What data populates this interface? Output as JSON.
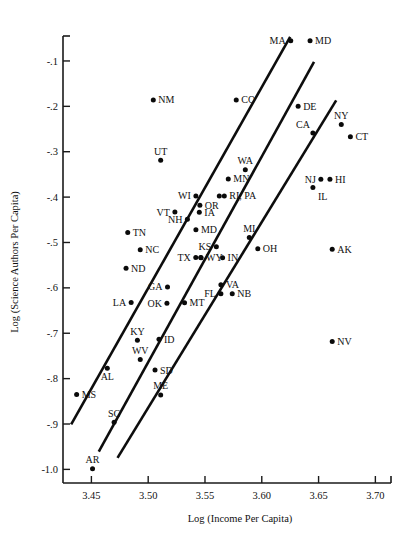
{
  "chart_data": {
    "type": "scatter",
    "title": "",
    "xlabel": "Log (Income Per Capita)",
    "ylabel": "Log (Science Authors Per Capita)",
    "xlim": [
      3.425,
      3.712
    ],
    "ylim": [
      -1.03,
      -0.045
    ],
    "grid": false,
    "legend": "none",
    "xticks": [
      "3.45",
      "3.50",
      "3.55",
      "3.60",
      "3.65",
      "3.70"
    ],
    "xtickvalues": [
      3.45,
      3.5,
      3.55,
      3.6,
      3.65,
      3.7
    ],
    "yticks": [
      "-.1",
      "-.2",
      "-.3",
      "-.4",
      "-.5",
      "-.6",
      "-.7",
      "-.8",
      "-.9",
      "-1.0"
    ],
    "ytickvalues": [
      -0.1,
      -0.2,
      -0.3,
      -0.4,
      -0.5,
      -0.6,
      -0.7,
      -0.8,
      -0.9,
      -1.0
    ],
    "points": [
      {
        "label": "MA",
        "x": 3.6255,
        "y": -0.0555,
        "lp": "left"
      },
      {
        "label": "MD",
        "x": 3.6425,
        "y": -0.0555,
        "lp": "right"
      },
      {
        "label": "NM",
        "x": 3.5045,
        "y": -0.186,
        "lp": "right"
      },
      {
        "label": "CO",
        "x": 3.5775,
        "y": -0.186,
        "lp": "right"
      },
      {
        "label": "DE",
        "x": 3.632,
        "y": -0.2,
        "lp": "right"
      },
      {
        "label": "CA",
        "x": 3.645,
        "y": -0.259,
        "lp": "upleft"
      },
      {
        "label": "NY",
        "x": 3.67,
        "y": -0.24,
        "lp": "up"
      },
      {
        "label": "CT",
        "x": 3.678,
        "y": -0.267,
        "lp": "right"
      },
      {
        "label": "UT",
        "x": 3.511,
        "y": -0.319,
        "lp": "up"
      },
      {
        "label": "WA",
        "x": 3.5855,
        "y": -0.34,
        "lp": "up"
      },
      {
        "label": "MN",
        "x": 3.5705,
        "y": -0.36,
        "lp": "right"
      },
      {
        "label": "NJ",
        "x": 3.652,
        "y": -0.3605,
        "lp": "left"
      },
      {
        "label": "HI",
        "x": 3.66,
        "y": -0.3605,
        "lp": "right"
      },
      {
        "label": "IL",
        "x": 3.645,
        "y": -0.379,
        "lp": "downright"
      },
      {
        "label": "WI",
        "x": 3.542,
        "y": -0.3975,
        "lp": "left"
      },
      {
        "label": "RI, PA",
        "x": 3.567,
        "y": -0.3975,
        "lp": "right2"
      },
      {
        "label": "OR",
        "x": 3.5455,
        "y": -0.418,
        "lp": "right"
      },
      {
        "label": "VT",
        "x": 3.5235,
        "y": -0.433,
        "lp": "left"
      },
      {
        "label": "IA",
        "x": 3.545,
        "y": -0.4335,
        "lp": "right"
      },
      {
        "label": "NH",
        "x": 3.5345,
        "y": -0.449,
        "lp": "left"
      },
      {
        "label": "MD2",
        "x": 3.542,
        "y": -0.472,
        "lp": "right"
      },
      {
        "label": "MI",
        "x": 3.589,
        "y": -0.489,
        "lp": "up"
      },
      {
        "label": "TN",
        "x": 3.482,
        "y": -0.478,
        "lp": "right"
      },
      {
        "label": "NC",
        "x": 3.493,
        "y": -0.516,
        "lp": "right"
      },
      {
        "label": "KS",
        "x": 3.56,
        "y": -0.5095,
        "lp": "left"
      },
      {
        "label": "OH",
        "x": 3.5965,
        "y": -0.514,
        "lp": "right"
      },
      {
        "label": "AK",
        "x": 3.662,
        "y": -0.515,
        "lp": "right"
      },
      {
        "label": "TX",
        "x": 3.5375,
        "y": -0.533,
        "lp": "left2"
      },
      {
        "label": "WY",
        "x": 3.5465,
        "y": -0.5335,
        "lp": "right"
      },
      {
        "label": "IN",
        "x": 3.5655,
        "y": -0.5335,
        "lp": "right"
      },
      {
        "label": "ND",
        "x": 3.4805,
        "y": -0.557,
        "lp": "right"
      },
      {
        "label": "VA",
        "x": 3.564,
        "y": -0.593,
        "lp": "right"
      },
      {
        "label": "GA",
        "x": 3.517,
        "y": -0.598,
        "lp": "left"
      },
      {
        "label": "FL",
        "x": 3.564,
        "y": -0.613,
        "lp": "left"
      },
      {
        "label": "NB",
        "x": 3.574,
        "y": -0.613,
        "lp": "right"
      },
      {
        "label": "LA",
        "x": 3.485,
        "y": -0.632,
        "lp": "left"
      },
      {
        "label": "OK",
        "x": 3.5165,
        "y": -0.634,
        "lp": "left"
      },
      {
        "label": "MT",
        "x": 3.532,
        "y": -0.633,
        "lp": "right"
      },
      {
        "label": "KY",
        "x": 3.4905,
        "y": -0.7155,
        "lp": "up"
      },
      {
        "label": "ID",
        "x": 3.5095,
        "y": -0.7135,
        "lp": "right"
      },
      {
        "label": "NV",
        "x": 3.662,
        "y": -0.718,
        "lp": "right"
      },
      {
        "label": "WV",
        "x": 3.493,
        "y": -0.758,
        "lp": "up"
      },
      {
        "label": "AL",
        "x": 3.464,
        "y": -0.777,
        "lp": "down"
      },
      {
        "label": "SD",
        "x": 3.506,
        "y": -0.781,
        "lp": "right"
      },
      {
        "label": "MS",
        "x": 3.437,
        "y": -0.835,
        "lp": "right"
      },
      {
        "label": "ME",
        "x": 3.511,
        "y": -0.836,
        "lp": "up"
      },
      {
        "label": "SC",
        "x": 3.47,
        "y": -0.896,
        "lp": "up"
      },
      {
        "label": "AR",
        "x": 3.451,
        "y": -0.9985,
        "lp": "up"
      }
    ],
    "fit_lines": [
      {
        "name": "upper-band-line",
        "x1": 3.4322,
        "y1": -0.901,
        "x2": 3.625,
        "y2": -0.047
      },
      {
        "name": "middle-band-line",
        "x1": 3.4565,
        "y1": -0.961,
        "x2": 3.646,
        "y2": -0.102
      },
      {
        "name": "lower-band-line",
        "x1": 3.473,
        "y1": -0.9745,
        "x2": 3.6655,
        "y2": -0.187
      }
    ]
  }
}
